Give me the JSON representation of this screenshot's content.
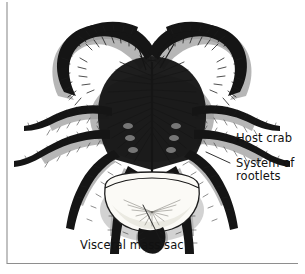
{
  "figure": {
    "alt_title": "Crab parasitized by rhizocephalan barnacle",
    "background_color": "#ffffff",
    "ink_color": "#151515",
    "wash_color": "#9a9a9a",
    "sac_fill_color": "#fbfaf6",
    "frame_color": "#8e8e8e"
  },
  "labels": [
    {
      "id": "host-crab",
      "text": "Host crab",
      "x": 236,
      "y": 142,
      "anchor": "start",
      "leader": "M 227 138 L 210 138"
    },
    {
      "id": "system-of-rootlets",
      "text": "System of",
      "text2": "rootlets",
      "x": 236,
      "y": 167,
      "y2": 180,
      "anchor": "start",
      "leader": "M 230 163 L 206 152"
    },
    {
      "id": "visceral-mass-sac",
      "text": "Visceral mass sac",
      "x": 80,
      "y": 249,
      "anchor": "start",
      "leader": "M 163 245 L 143 205"
    }
  ],
  "frame": {
    "left_line": "M 7 2 L 7 264",
    "bottom_line": "M 7 263.5 L 298 263.5"
  }
}
